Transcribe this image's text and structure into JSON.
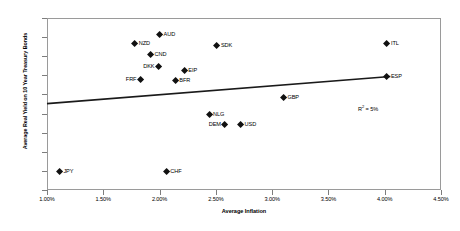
{
  "chart_data": {
    "type": "scatter",
    "title": "",
    "xlabel": "Average Inflation",
    "ylabel": "Average Real Yield on 10 Year Treasury Bonds",
    "xlim": [
      1.0,
      4.5
    ],
    "ylim": [
      2.0,
      6.5
    ],
    "xticks": [
      "1.00%",
      "1.50%",
      "2.00%",
      "2.50%",
      "3.00%",
      "3.50%",
      "4.00%",
      "4.50%"
    ],
    "xtick_values": [
      1.0,
      1.5,
      2.0,
      2.5,
      3.0,
      3.5,
      4.0,
      4.5
    ],
    "yticks": [
      "2.00%",
      "2.50%",
      "3.00%",
      "3.50%",
      "4.00%",
      "4.50%",
      "5.00%",
      "5.50%",
      "6.00%",
      "6.50%"
    ],
    "ytick_values": [
      2.0,
      2.5,
      3.0,
      3.5,
      4.0,
      4.5,
      5.0,
      5.5,
      6.0,
      6.5
    ],
    "grid": false,
    "legend": "none",
    "points": [
      {
        "label": "AUD",
        "x": 2.0,
        "y": 6.07,
        "label_side": "right"
      },
      {
        "label": "NZD",
        "x": 1.78,
        "y": 5.83,
        "label_side": "right"
      },
      {
        "label": "ITL",
        "x": 4.02,
        "y": 5.82,
        "label_side": "right"
      },
      {
        "label": "CND",
        "x": 1.92,
        "y": 5.53,
        "label_side": "right"
      },
      {
        "label": "SDK",
        "x": 2.51,
        "y": 5.78,
        "label_side": "right"
      },
      {
        "label": "DKK",
        "x": 1.99,
        "y": 5.23,
        "label_side": "left"
      },
      {
        "label": "EIP",
        "x": 2.22,
        "y": 5.12,
        "label_side": "right"
      },
      {
        "label": "ESP",
        "x": 4.02,
        "y": 4.97,
        "label_side": "right"
      },
      {
        "label": "BFR",
        "x": 2.14,
        "y": 4.86,
        "label_side": "right"
      },
      {
        "label": "FRF",
        "x": 1.83,
        "y": 4.9,
        "label_side": "left"
      },
      {
        "label": "GBP",
        "x": 3.1,
        "y": 4.42,
        "label_side": "right"
      },
      {
        "label": "NLG",
        "x": 2.44,
        "y": 3.97,
        "label_side": "right"
      },
      {
        "label": "USD",
        "x": 2.72,
        "y": 3.7,
        "label_side": "right"
      },
      {
        "label": "DEM",
        "x": 2.58,
        "y": 3.7,
        "label_side": "left"
      },
      {
        "label": "CHF",
        "x": 2.06,
        "y": 2.49,
        "label_side": "right"
      },
      {
        "label": "JPY",
        "x": 1.11,
        "y": 2.49,
        "label_side": "right"
      }
    ],
    "trendline": {
      "x_start": 1.0,
      "y_start": 4.26,
      "x_end": 4.05,
      "y_end": 4.97
    },
    "annotations": [
      {
        "name": "r-squared",
        "text_prefix": "R",
        "text_sup": "2",
        "text_suffix": " = 5%"
      }
    ]
  },
  "colors": {
    "marker": "#111111",
    "trendline": "#1a1a1a",
    "axis": "#9a9a9a",
    "background": "#ffffff",
    "text": "#000000"
  }
}
